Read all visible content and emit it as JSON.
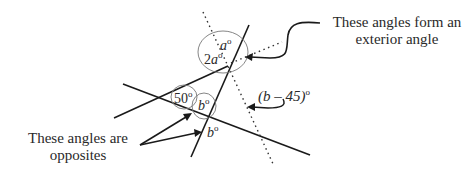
{
  "annotations": {
    "exterior": [
      "These angles form an",
      "exterior angle"
    ],
    "opposites": [
      "These angles are",
      "opposites"
    ]
  },
  "angle_labels": {
    "a_var": "a",
    "two_a_coef": "2",
    "fifty": "50",
    "b_var": "b",
    "b_minus_45": "(b – 45)",
    "degree": "o"
  }
}
